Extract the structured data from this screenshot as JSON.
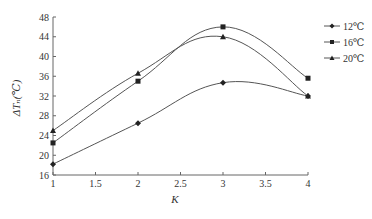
{
  "chart_data": {
    "type": "line",
    "title": "",
    "xlabel": "K",
    "ylabel": "ΔTₙ(℃)",
    "x": [
      1,
      2,
      3,
      4
    ],
    "xlim": [
      1,
      4
    ],
    "ylim": [
      16,
      48
    ],
    "xticks": [
      "1",
      "1.5",
      "2",
      "2.5",
      "3",
      "3.5",
      "4"
    ],
    "yticks": [
      "16",
      "20",
      "24",
      "28",
      "32",
      "36",
      "40",
      "44",
      "48"
    ],
    "grid": false,
    "legend_position": "upper-right",
    "smooth": true,
    "series": [
      {
        "name": "12℃",
        "marker": "diamond",
        "values": [
          18.2,
          26.5,
          34.7,
          32.0
        ]
      },
      {
        "name": "16℃",
        "marker": "square",
        "values": [
          22.5,
          35.0,
          46.0,
          35.6
        ]
      },
      {
        "name": "20℃",
        "marker": "triangle",
        "values": [
          25.0,
          36.6,
          44.0,
          32.0
        ]
      }
    ]
  },
  "colors": {
    "line": "#555555",
    "marker": "#222222",
    "axis": "#666666"
  }
}
